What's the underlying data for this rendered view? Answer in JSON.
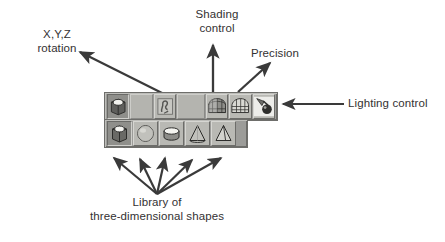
{
  "figure": {
    "kind": "annotated-screenshot-diagram",
    "ink_color": "#3a3a3a",
    "paper_color": "#ffffff",
    "toolbar_face_color": "#9c9c99",
    "button_face_color": "#b9b9b4"
  },
  "callouts": [
    {
      "id": "rotation",
      "text": "X,Y,Z\nrotation",
      "arrow": "points down-right toward the rotation button in the top toolbar"
    },
    {
      "id": "shading",
      "text": "Shading\ncontrol",
      "arrow": "points straight down to the shading button in the top toolbar"
    },
    {
      "id": "precision",
      "text": "Precision",
      "arrow": "points down-left to the precision button in the top toolbar"
    },
    {
      "id": "lighting",
      "text": "Lighting control",
      "arrow": "points left to the lighting button at the right end of the top toolbar"
    },
    {
      "id": "library",
      "text": "Library of\nthree-dimensional shapes",
      "arrow": "five arrows fan upward to each button of the bottom shapes toolbar"
    }
  ],
  "toolbars": {
    "top": {
      "name": "3-D settings toolbar",
      "buttons": [
        {
          "icon": "cube-rotation-icon",
          "label": "X,Y,Z rotation",
          "state": "pressed",
          "type": "button"
        },
        {
          "icon": "blank-icon",
          "label": "",
          "state": "empty",
          "type": "blank"
        },
        {
          "icon": "depth-icon",
          "label": "Depth",
          "state": "normal",
          "type": "button"
        },
        {
          "icon": "blank-icon",
          "label": "",
          "state": "empty",
          "type": "blank"
        },
        {
          "icon": "shading-grid-icon",
          "label": "Shading control",
          "state": "normal",
          "type": "button"
        },
        {
          "icon": "precision-grid-icon",
          "label": "Precision",
          "state": "normal",
          "type": "button"
        },
        {
          "icon": "lighting-icon",
          "label": "Lighting control",
          "state": "normal",
          "type": "button"
        }
      ]
    },
    "bottom": {
      "name": "Library of three-dimensional shapes",
      "buttons": [
        {
          "icon": "cube-shape-icon",
          "label": "Cube",
          "state": "pressed",
          "type": "shape"
        },
        {
          "icon": "sphere-shape-icon",
          "label": "Sphere",
          "state": "normal",
          "type": "shape"
        },
        {
          "icon": "cylinder-shape-icon",
          "label": "Cylinder",
          "state": "normal",
          "type": "shape"
        },
        {
          "icon": "cone-shape-icon",
          "label": "Cone",
          "state": "normal",
          "type": "shape"
        },
        {
          "icon": "pyramid-shape-icon",
          "label": "Pyramid",
          "state": "normal",
          "type": "shape"
        }
      ]
    }
  }
}
